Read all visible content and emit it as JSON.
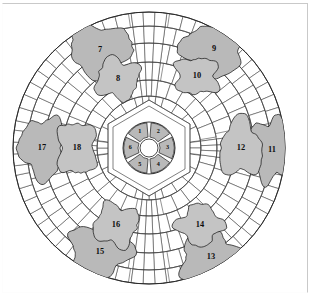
{
  "figure": {
    "type": "architectural-site-plan"
  },
  "colors": {
    "background": "#ffffff",
    "paving_fill": "#ffffff",
    "paving_stroke": "#3a3a3a",
    "region_fill": "#b9b9b9",
    "region_fill_light": "#c4c4c4",
    "region_stroke": "#1a1a1a",
    "label_color": "#0d0d0d",
    "frame_border": "#c9c9c9"
  },
  "geometry": {
    "center_x": 149,
    "center_y": 148,
    "outer_radius": 136,
    "ring_radii": [
      26,
      38,
      52,
      68,
      86,
      105,
      122,
      136
    ],
    "hex_radius": 48,
    "hub_radius": 9,
    "rosette_inner_radius": 11,
    "rosette_outer_radius": 26
  },
  "center_rosette": {
    "name": "six-petal rosette",
    "petal_count": 6,
    "petals": [
      {
        "id": 1,
        "label": "1",
        "position": "top-left",
        "angle_deg": 240
      },
      {
        "id": 2,
        "label": "2",
        "position": "top-right",
        "angle_deg": 300
      },
      {
        "id": 3,
        "label": "3",
        "position": "right",
        "angle_deg": 0
      },
      {
        "id": 4,
        "label": "4",
        "position": "bottom-right",
        "angle_deg": 60
      },
      {
        "id": 5,
        "label": "5",
        "position": "bottom-left",
        "angle_deg": 120
      },
      {
        "id": 6,
        "label": "6",
        "position": "left",
        "angle_deg": 180
      }
    ]
  },
  "regions": [
    {
      "id": 7,
      "label": "7",
      "quadrant": "upper-left",
      "ring": "outer",
      "cx": 100,
      "cy": 50
    },
    {
      "id": 8,
      "label": "8",
      "quadrant": "upper-left",
      "ring": "inner",
      "cx": 118,
      "cy": 79
    },
    {
      "id": 9,
      "label": "9",
      "quadrant": "upper-right",
      "ring": "outer",
      "cx": 214,
      "cy": 49
    },
    {
      "id": 10,
      "label": "10",
      "quadrant": "upper-right",
      "ring": "inner",
      "cx": 197,
      "cy": 76
    },
    {
      "id": 11,
      "label": "11",
      "quadrant": "right",
      "ring": "outer",
      "cx": 272,
      "cy": 150
    },
    {
      "id": 12,
      "label": "12",
      "quadrant": "right",
      "ring": "inner",
      "cx": 241,
      "cy": 148
    },
    {
      "id": 13,
      "label": "13",
      "quadrant": "lower-right",
      "ring": "outer",
      "cx": 211,
      "cy": 257
    },
    {
      "id": 14,
      "label": "14",
      "quadrant": "lower-right",
      "ring": "inner",
      "cx": 200,
      "cy": 225
    },
    {
      "id": 15,
      "label": "15",
      "quadrant": "lower-left",
      "ring": "outer",
      "cx": 100,
      "cy": 252
    },
    {
      "id": 16,
      "label": "16",
      "quadrant": "lower-left",
      "ring": "inner",
      "cx": 116,
      "cy": 225
    },
    {
      "id": 17,
      "label": "17",
      "quadrant": "left",
      "ring": "outer",
      "cx": 42,
      "cy": 148
    },
    {
      "id": 18,
      "label": "18",
      "quadrant": "left",
      "ring": "inner",
      "cx": 77,
      "cy": 148
    }
  ],
  "counts": {
    "total_numbered_regions": 18,
    "center_petals": 6,
    "outer_shaded_beds": 12,
    "concentric_rings": 7
  }
}
